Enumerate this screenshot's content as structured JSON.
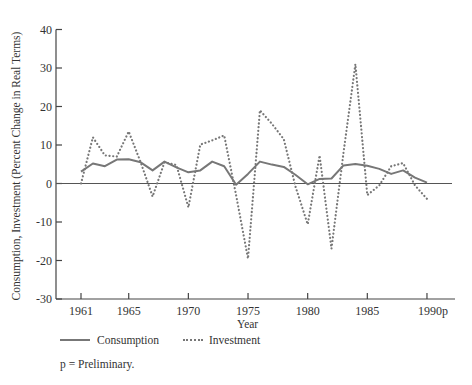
{
  "chart_data": {
    "type": "line",
    "title": "",
    "xlabel": "Year",
    "ylabel": "Consumption, Investment (Percent Change in Real Terms)",
    "ylim": [
      -30,
      40
    ],
    "yticks": [
      40,
      30,
      20,
      10,
      0,
      -10,
      -20,
      -30
    ],
    "xticks": [
      "1961",
      "1965",
      "1970",
      "1975",
      "1980",
      "1985",
      "1990p"
    ],
    "xtick_years": [
      1961,
      1965,
      1970,
      1975,
      1980,
      1985,
      1990
    ],
    "grid": false,
    "legend_position": "bottom",
    "x": [
      1961,
      1962,
      1963,
      1964,
      1965,
      1966,
      1967,
      1968,
      1969,
      1970,
      1971,
      1972,
      1973,
      1974,
      1975,
      1976,
      1977,
      1978,
      1979,
      1980,
      1981,
      1982,
      1983,
      1984,
      1985,
      1986,
      1987,
      1988,
      1989,
      1990
    ],
    "series": [
      {
        "name": "Consumption",
        "style": "solid",
        "values": [
          3.1,
          5.2,
          4.5,
          6.2,
          6.3,
          5.5,
          3.4,
          5.7,
          4.2,
          2.9,
          3.4,
          5.7,
          4.5,
          -0.3,
          2.5,
          5.7,
          4.9,
          4.3,
          2.2,
          -0.2,
          1.2,
          1.3,
          4.7,
          5.1,
          4.6,
          3.8,
          2.5,
          3.4,
          1.5,
          0.2
        ]
      },
      {
        "name": "Investment",
        "style": "dotted",
        "values": [
          0,
          12,
          7.3,
          7,
          13.5,
          5.5,
          -3.4,
          5.5,
          4.8,
          -6.2,
          10.1,
          11.2,
          12.5,
          -3,
          -19.5,
          19,
          15.5,
          11.5,
          -1,
          -10.6,
          7.3,
          -16.9,
          8,
          31,
          -3,
          -0.5,
          4.5,
          5.3,
          -0.5,
          -4
        ]
      }
    ]
  },
  "legend": {
    "consumption": "Consumption",
    "investment": "Investment"
  },
  "note": "p = Preliminary."
}
